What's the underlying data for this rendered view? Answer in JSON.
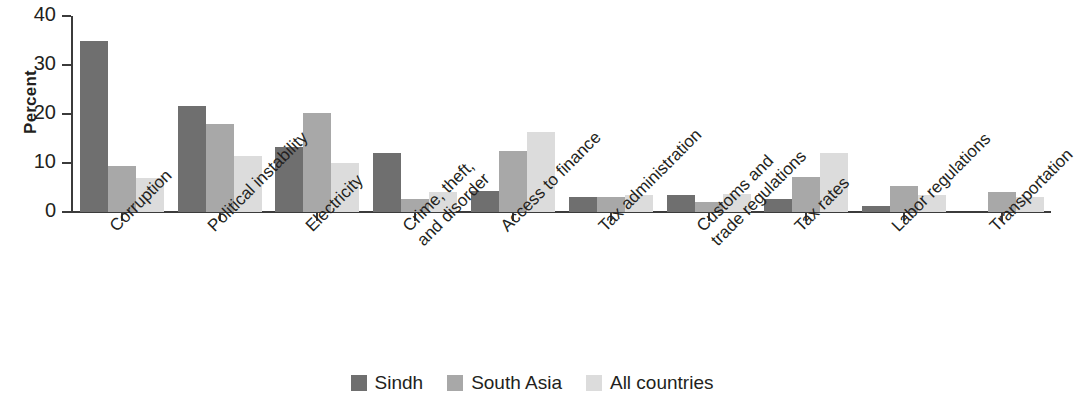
{
  "chart_data": {
    "type": "bar",
    "title": "",
    "subtitle": "",
    "xlabel": "",
    "ylabel": "Percent",
    "ylim": [
      0,
      40
    ],
    "yticks": [
      0,
      10,
      20,
      30,
      40
    ],
    "ytick_labels": [
      "0",
      "10",
      "20",
      "30",
      "40"
    ],
    "grid": false,
    "legend_position": "bottom-center",
    "categories": [
      "Corruption",
      "Political instability",
      "Electricity",
      "Crime, theft,\nand disorder",
      "Access to finance",
      "Tax administration",
      "Customs and\ntrade regulations",
      "Tax rates",
      "Labor regulations",
      "Transportation"
    ],
    "category_lines": [
      [
        "Corruption"
      ],
      [
        "Political instability"
      ],
      [
        "Electricity"
      ],
      [
        "Crime, theft,",
        "and disorder"
      ],
      [
        "Access to finance"
      ],
      [
        "Tax administration"
      ],
      [
        "Customs and",
        "trade regulations"
      ],
      [
        "Tax rates"
      ],
      [
        "Labor regulations"
      ],
      [
        "Transportation"
      ]
    ],
    "series": [
      {
        "name": "Sindh",
        "color": "#6f6f6f",
        "values": [
          35.0,
          21.7,
          13.3,
          12.0,
          4.2,
          3.0,
          3.4,
          2.7,
          1.2,
          0.0
        ]
      },
      {
        "name": "South Asia",
        "color": "#a8a8a8",
        "values": [
          9.3,
          17.9,
          20.3,
          2.7,
          12.4,
          3.1,
          2.1,
          7.2,
          5.3,
          4.0
        ]
      },
      {
        "name": "All countries",
        "color": "#dcdcdc",
        "values": [
          7.0,
          11.4,
          10.0,
          4.0,
          16.3,
          3.5,
          3.7,
          12.1,
          3.5,
          3.0
        ]
      }
    ]
  },
  "legend": {
    "items": [
      {
        "label": "Sindh",
        "color": "#6f6f6f"
      },
      {
        "label": "South Asia",
        "color": "#a8a8a8"
      },
      {
        "label": "All countries",
        "color": "#dcdcdc"
      }
    ]
  }
}
